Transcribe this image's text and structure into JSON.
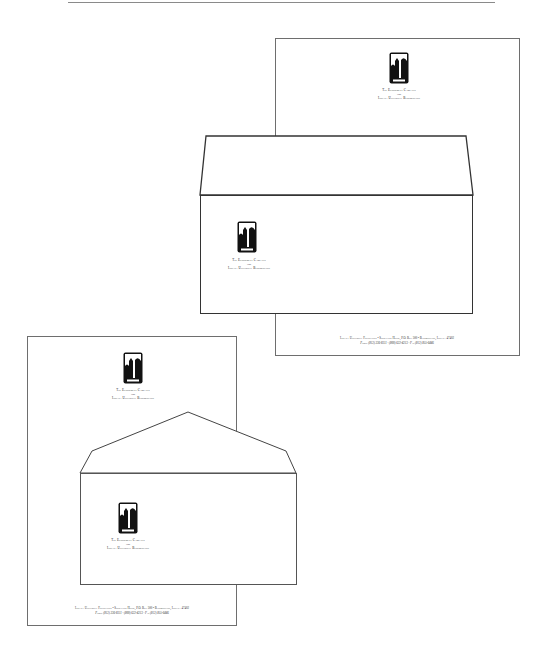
{
  "letterhead": {
    "campaign_line1": "The Endowment Campaign",
    "campaign_line2": "for",
    "campaign_line3": "Indiana University Bloomington",
    "footer_line1": "Indiana University Foundation • Showalter House, P.O. Box 500 • Bloomington, Indiana 47402",
    "footer_line2": "Phone (812) 336-8311 · (800) 622-4213 · Fax (812) 855-6446"
  },
  "envelope": {
    "campaign_line1": "The Endowment Campaign",
    "campaign_line2": "for",
    "campaign_line3": "Indiana University Bloomington"
  },
  "colors": {
    "line": "#333333",
    "sheet_border": "#6e6e6e",
    "logo": "#111111"
  }
}
